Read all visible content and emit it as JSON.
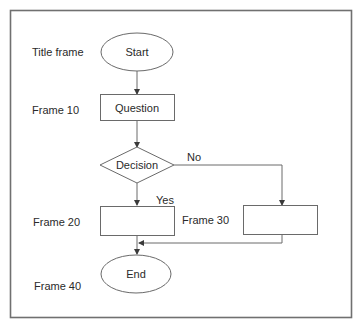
{
  "diagram": {
    "type": "flowchart",
    "row_labels": {
      "title_frame": "Title frame",
      "frame_10": "Frame 10",
      "frame_20": "Frame 20",
      "frame_30": "Frame 30",
      "frame_40": "Frame 40"
    },
    "nodes": {
      "start": "Start",
      "question": "Question",
      "decision": "Decision",
      "frame20_box": "",
      "frame30_box": "",
      "end": "End"
    },
    "edges": {
      "yes_label": "Yes",
      "no_label": "No"
    },
    "colors": {
      "stroke": "#6a6a6a",
      "text": "#2a2a2a",
      "background": "#ffffff"
    }
  }
}
